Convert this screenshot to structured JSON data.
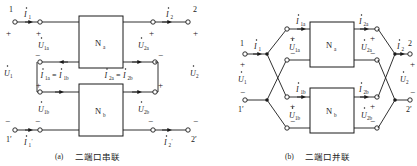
{
  "figure": {
    "panels": [
      {
        "id": "a",
        "caption_label": "(a)",
        "caption_text": "二端口串联",
        "blocks": [
          {
            "name": "N",
            "sub": "a"
          },
          {
            "name": "N",
            "sub": "b"
          }
        ],
        "terminals": [
          "1",
          "2",
          "1'",
          "2'"
        ],
        "currents": [
          {
            "sym": "I",
            "sub": "1",
            "prime": false
          },
          {
            "sym": "I",
            "sub": "2",
            "prime": false
          },
          {
            "sym": "I",
            "sub": "1",
            "prime": true
          },
          {
            "sym": "I",
            "sub": "2",
            "prime": true
          }
        ],
        "current_equalities": [
          {
            "left_sym": "I",
            "left_sub": "1a",
            "right_sym": "I",
            "right_sub": "1b",
            "op": "="
          },
          {
            "left_sym": "I",
            "left_sub": "2a",
            "right_sym": "I",
            "right_sub": "2b",
            "op": "="
          }
        ],
        "voltages": [
          {
            "sym": "U",
            "sub": "1"
          },
          {
            "sym": "U",
            "sub": "2"
          },
          {
            "sym": "U",
            "sub": "1a"
          },
          {
            "sym": "U",
            "sub": "2a"
          },
          {
            "sym": "U",
            "sub": "1b"
          },
          {
            "sym": "U",
            "sub": "2b"
          }
        ],
        "polarity_signs": [
          "+",
          "+",
          "+",
          "+",
          "+",
          "+",
          "−",
          "−",
          "−",
          "−",
          "−",
          "−"
        ]
      },
      {
        "id": "b",
        "caption_label": "(b)",
        "caption_text": "二端口并联",
        "blocks": [
          {
            "name": "N",
            "sub": "a"
          },
          {
            "name": "N",
            "sub": "b"
          }
        ],
        "terminals": [
          "1",
          "2",
          "1'",
          "2'"
        ],
        "currents": [
          {
            "sym": "I",
            "sub": "1",
            "prime": false
          },
          {
            "sym": "I",
            "sub": "2",
            "prime": false
          },
          {
            "sym": "I",
            "sub": "1a",
            "prime": false
          },
          {
            "sym": "I",
            "sub": "2a",
            "prime": false
          },
          {
            "sym": "I",
            "sub": "1b",
            "prime": false
          },
          {
            "sym": "I",
            "sub": "2b",
            "prime": false
          }
        ],
        "voltages": [
          {
            "sym": "U",
            "sub": "1"
          },
          {
            "sym": "U",
            "sub": "2"
          },
          {
            "sym": "U",
            "sub": "1a"
          },
          {
            "sym": "U",
            "sub": "2a"
          },
          {
            "sym": "U",
            "sub": "1b"
          },
          {
            "sym": "U",
            "sub": "2b"
          }
        ],
        "polarity_signs": [
          "+",
          "+",
          "+",
          "+",
          "+",
          "+",
          "−",
          "−",
          "−",
          "−",
          "−",
          "−"
        ]
      }
    ],
    "colors": {
      "ink": "#1a1a1a",
      "background": "#ffffff"
    }
  },
  "text": {
    "N": "N",
    "sub_a": "a",
    "sub_b": "b",
    "plus": "+",
    "minus": "−",
    "equals": "=",
    "prime": "′",
    "U": "U",
    "I": "I",
    "t1": "1",
    "t2": "2",
    "t1p": "1′",
    "t2p": "2′",
    "s1": "1",
    "s2": "2",
    "s1a": "1a",
    "s2a": "2a",
    "s1b": "1b",
    "s2b": "2b",
    "cap_a_label": "(a)",
    "cap_a_text": "二端口串联",
    "cap_b_label": "(b)",
    "cap_b_text": "二端口并联"
  }
}
